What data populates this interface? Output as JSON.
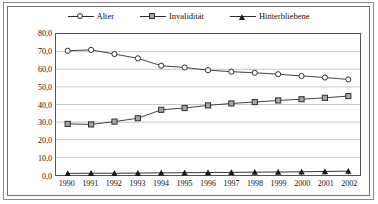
{
  "chart_data": {
    "type": "line",
    "title": "",
    "xlabel": "",
    "ylabel": "",
    "categories": [
      "1990",
      "1991",
      "1992",
      "1993",
      "1994",
      "1995",
      "1996",
      "1997",
      "1998",
      "1999",
      "2000",
      "2001",
      "2002"
    ],
    "ylim": [
      0,
      80
    ],
    "y_ticks": [
      0,
      10,
      20,
      30,
      40,
      50,
      60,
      70,
      80
    ],
    "y_tick_labels": [
      "0,0",
      "10,0",
      "20,0",
      "30,0",
      "40,0",
      "50,0",
      "60,0",
      "70,0",
      "80,0"
    ],
    "grid": true,
    "legend_position": "top-center",
    "decimal_separator": ",",
    "series": [
      {
        "name": "Alter",
        "marker": "circle-open",
        "color": "#2c2c2c",
        "values": [
          70.5,
          71.0,
          68.6,
          66.2,
          62.0,
          61.0,
          59.5,
          58.6,
          58.0,
          57.2,
          56.2,
          55.3,
          54.2
        ]
      },
      {
        "name": "Invalidität",
        "marker": "square-filled",
        "color": "#2c2c2c",
        "values": [
          29.0,
          28.7,
          30.3,
          32.2,
          37.0,
          38.0,
          39.5,
          40.6,
          41.4,
          42.3,
          43.0,
          43.8,
          44.8
        ]
      },
      {
        "name": "Hinterbliebene",
        "marker": "triangle-filled",
        "color": "#1a1a1a",
        "values": [
          0.9,
          1.0,
          1.0,
          1.1,
          1.2,
          1.3,
          1.4,
          1.5,
          1.6,
          1.7,
          1.8,
          2.0,
          2.2
        ]
      }
    ]
  },
  "legend": {
    "entries": [
      {
        "label": "Alter",
        "marker": "circle-open"
      },
      {
        "label": "Invalidität",
        "marker": "square-filled"
      },
      {
        "label": "Hinterbliebene",
        "marker": "triangle-filled"
      }
    ]
  }
}
